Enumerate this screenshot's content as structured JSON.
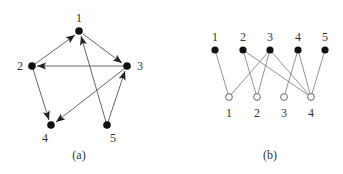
{
  "graph_a": {
    "caption": "(a)",
    "nodes": [
      {
        "id": "1",
        "label": "1"
      },
      {
        "id": "2",
        "label": "2"
      },
      {
        "id": "3",
        "label": "3"
      },
      {
        "id": "4",
        "label": "4"
      },
      {
        "id": "5",
        "label": "5"
      }
    ],
    "edges": [
      {
        "from": "2",
        "to": "1"
      },
      {
        "from": "1",
        "to": "3"
      },
      {
        "from": "3",
        "to": "2"
      },
      {
        "from": "2",
        "to": "4"
      },
      {
        "from": "3",
        "to": "4"
      },
      {
        "from": "5",
        "to": "1"
      },
      {
        "from": "5",
        "to": "3"
      }
    ]
  },
  "graph_b": {
    "caption": "(b)",
    "top_nodes": [
      {
        "id": "t1",
        "label": "1"
      },
      {
        "id": "t2",
        "label": "2"
      },
      {
        "id": "t3",
        "label": "3"
      },
      {
        "id": "t4",
        "label": "4"
      },
      {
        "id": "t5",
        "label": "5"
      }
    ],
    "bottom_nodes": [
      {
        "id": "b1",
        "label": "1"
      },
      {
        "id": "b2",
        "label": "2"
      },
      {
        "id": "b3",
        "label": "3"
      },
      {
        "id": "b4",
        "label": "4"
      }
    ],
    "edges": [
      {
        "from": "t1",
        "to": "b1"
      },
      {
        "from": "t2",
        "to": "b2"
      },
      {
        "from": "t2",
        "to": "b4"
      },
      {
        "from": "t3",
        "to": "b1"
      },
      {
        "from": "t3",
        "to": "b2"
      },
      {
        "from": "t3",
        "to": "b4"
      },
      {
        "from": "t4",
        "to": "b3"
      },
      {
        "from": "t4",
        "to": "b4"
      },
      {
        "from": "t5",
        "to": "b4"
      }
    ]
  },
  "colors": {
    "node_fill": "#111111",
    "edge": "#555555",
    "text": "#333333"
  }
}
